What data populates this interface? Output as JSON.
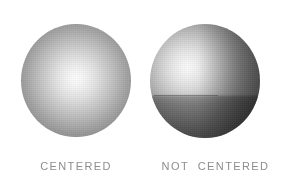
{
  "figure": {
    "background_color": "#ffffff",
    "width": 283,
    "height": 184,
    "caption_color": "#8d8d8d"
  },
  "spheres": [
    {
      "id": "centered",
      "caption": "CENTERED",
      "highlight_position": "center",
      "highlight_color": "#fdfdfd",
      "rim_color": "#727272",
      "bounds": {
        "x": 21,
        "y": 24,
        "width": 110,
        "height": 113
      }
    },
    {
      "id": "not-centered",
      "caption": "NOT  CENTERED",
      "highlight_position": "upper-left",
      "highlight_color": "#fbfbfb",
      "shadow_color": "#494949",
      "terminator": "horizontal edge across lower-left",
      "bounds": {
        "x": 150,
        "y": 24,
        "width": 110,
        "height": 114
      }
    }
  ]
}
